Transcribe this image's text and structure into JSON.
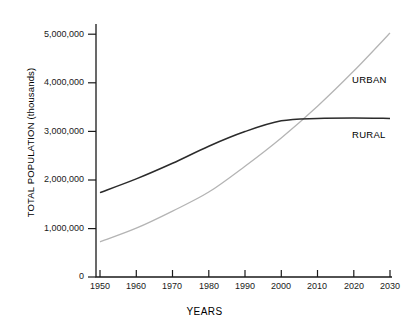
{
  "chart_data": {
    "type": "line",
    "title": "",
    "xlabel": "YEARS",
    "ylabel": "TOTAL POPULATION (thousands)",
    "xlim": [
      1950,
      2030
    ],
    "ylim": [
      0,
      5000000
    ],
    "xticks": [
      "1950",
      "1960",
      "1970",
      "1980",
      "1990",
      "2000",
      "2010",
      "2020",
      "2030"
    ],
    "yticks": [
      "0",
      "1,000,000",
      "2,000,000",
      "3,000,000",
      "4,000,000",
      "5,000,000"
    ],
    "grid": false,
    "legend_position": "inline-right",
    "x": [
      1950,
      1960,
      1970,
      1980,
      1990,
      2000,
      2010,
      2020,
      2030
    ],
    "series": [
      {
        "name": "RURAL",
        "color": "#2b2b2b",
        "values": [
          1730000,
          2010000,
          2330000,
          2680000,
          2980000,
          3200000,
          3250000,
          3260000,
          3250000
        ]
      },
      {
        "name": "URBAN",
        "color": "#b4b4b4",
        "values": [
          720000,
          1000000,
          1350000,
          1740000,
          2270000,
          2850000,
          3500000,
          4220000,
          5000000
        ]
      }
    ],
    "annotations": [
      {
        "text": "URBAN",
        "series": "URBAN"
      },
      {
        "text": "RURAL",
        "series": "RURAL"
      }
    ]
  }
}
